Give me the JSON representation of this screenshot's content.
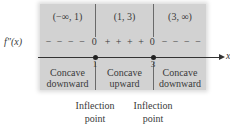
{
  "diagram": {
    "row_label": "f″(x)",
    "axis_label": "x",
    "intervals": [
      {
        "label": "(−∞, 1)",
        "sign": "− − − −",
        "concavity_line1": "Concave",
        "concavity_line2": "downward"
      },
      {
        "label": "(1, 3)",
        "sign": "+ + + +",
        "concavity_line1": "Concave",
        "concavity_line2": "upward"
      },
      {
        "label": "(3, ∞)",
        "sign": "− − − −",
        "concavity_line1": "Concave",
        "concavity_line2": "downward"
      }
    ],
    "critical_points": [
      {
        "x": "1",
        "value": "0",
        "note_line1": "Inflection",
        "note_line2": "point"
      },
      {
        "x": "3",
        "value": "0",
        "note_line1": "Inflection",
        "note_line2": "point"
      }
    ],
    "colors": {
      "shading": "#d2d2d2",
      "line": "#333333",
      "text": "#3a3a3a"
    }
  }
}
